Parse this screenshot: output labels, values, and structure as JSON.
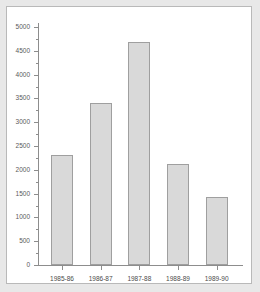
{
  "chart_data": {
    "type": "bar",
    "title": "",
    "xlabel": "",
    "ylabel": "",
    "categories": [
      "1985-86",
      "1986-87",
      "1987-88",
      "1988-89",
      "1989-90"
    ],
    "values": [
      2310,
      3410,
      4690,
      2130,
      1430
    ],
    "ylim": [
      0,
      5000
    ],
    "ytick_step": 500,
    "ytick_labels": [
      "0",
      "500",
      "1000",
      "1500",
      "2000",
      "2500",
      "3000",
      "3500",
      "4000",
      "4500",
      "5000"
    ],
    "ytick_values": [
      0,
      500,
      1000,
      1500,
      2000,
      2500,
      3000,
      3500,
      4000,
      4500,
      5000
    ],
    "minor_ticks": true,
    "grid": false,
    "legend": null,
    "bar_color": "#d9d9d9",
    "bar_border_color": "#9f9f9f",
    "axis_color": "#8d8d8d",
    "plot_background": "#ffffff",
    "page_background": "#e8e8e8",
    "frame_border_color": "#b9b9b9"
  }
}
